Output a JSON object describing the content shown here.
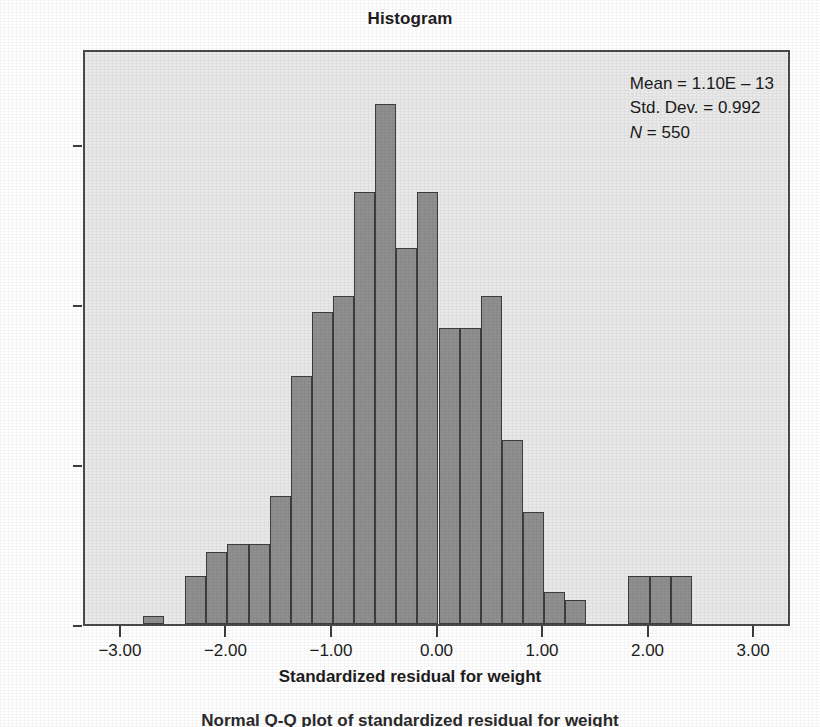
{
  "chart_data": {
    "type": "bar",
    "title": "Histogram",
    "xlabel": "Standardized residual for weight",
    "ylabel": "Frequency",
    "xlim": [
      -3.35,
      3.35
    ],
    "ylim": [
      0,
      72
    ],
    "grid": false,
    "legend": null,
    "bin_width": 0.2,
    "bin_centers": [
      -2.7,
      -2.5,
      -2.3,
      -2.1,
      -1.9,
      -1.7,
      -1.5,
      -1.3,
      -1.1,
      -0.9,
      -0.7,
      -0.5,
      -0.3,
      -0.1,
      0.1,
      0.3,
      0.5,
      0.7,
      0.9,
      1.1,
      1.3,
      1.5,
      1.7,
      1.9,
      2.1,
      2.3,
      2.5,
      2.7,
      2.9,
      3.1
    ],
    "categories": [
      "-2.7",
      "-2.5",
      "-2.3",
      "-2.1",
      "-1.9",
      "-1.7",
      "-1.5",
      "-1.3",
      "-1.1",
      "-0.9",
      "-0.7",
      "-0.5",
      "-0.3",
      "-0.1",
      "0.1",
      "0.3",
      "0.5",
      "0.7",
      "0.9",
      "1.1",
      "1.3",
      "1.5",
      "1.7",
      "1.9",
      "2.1",
      "2.3",
      "2.5",
      "2.7",
      "2.9",
      "3.1"
    ],
    "values": [
      1,
      0,
      6,
      9,
      10,
      10,
      16,
      31,
      39,
      41,
      54,
      65,
      47,
      54,
      37,
      37,
      41,
      23,
      14,
      4,
      3,
      0,
      0,
      0,
      6,
      6,
      6,
      0,
      0,
      0
    ],
    "bars": [
      {
        "x": -2.7,
        "value": 1
      },
      {
        "x": -2.3,
        "value": 6
      },
      {
        "x": -2.1,
        "value": 9
      },
      {
        "x": -1.9,
        "value": 10
      },
      {
        "x": -1.7,
        "value": 10
      },
      {
        "x": -1.5,
        "value": 16
      },
      {
        "x": -1.3,
        "value": 31
      },
      {
        "x": -1.1,
        "value": 39
      },
      {
        "x": -0.9,
        "value": 41
      },
      {
        "x": -0.7,
        "value": 54
      },
      {
        "x": -0.5,
        "value": 65
      },
      {
        "x": -0.3,
        "value": 47
      },
      {
        "x": -0.1,
        "value": 54
      },
      {
        "x": 0.1,
        "value": 37
      },
      {
        "x": 0.3,
        "value": 37
      },
      {
        "x": 0.5,
        "value": 41
      },
      {
        "x": 0.7,
        "value": 23
      },
      {
        "x": 0.9,
        "value": 14
      },
      {
        "x": 1.1,
        "value": 4
      },
      {
        "x": 1.3,
        "value": 3
      },
      {
        "x": 1.9,
        "value": 6
      },
      {
        "x": 2.1,
        "value": 6
      },
      {
        "x": 2.3,
        "value": 6
      }
    ],
    "yticks": [
      0,
      20,
      40,
      60
    ],
    "ytick_labels": [
      "0",
      "20",
      "40",
      "60"
    ],
    "xticks": [
      -3.0,
      -2.0,
      -1.0,
      0.0,
      1.0,
      2.0,
      3.0
    ],
    "xtick_labels": [
      "−3.00",
      "−2.00",
      "−1.00",
      "0.00",
      "1.00",
      "2.00",
      "3.00"
    ],
    "annotations": {
      "mean_label": "Mean = 1.10E – 13",
      "std_dev_label": "Std. Dev. = 0.992",
      "n_label": "N",
      "n_value": " = 550"
    },
    "colors": {
      "bar_fill": "#8f8f8f",
      "bar_edge": "#3d3d3d",
      "plot_background": "#e9e9e9",
      "frame": "#4a4a4a",
      "text": "#1d1d1d"
    }
  },
  "caption": {
    "text": "Normal Q-Q plot of standardized residual for weight"
  }
}
